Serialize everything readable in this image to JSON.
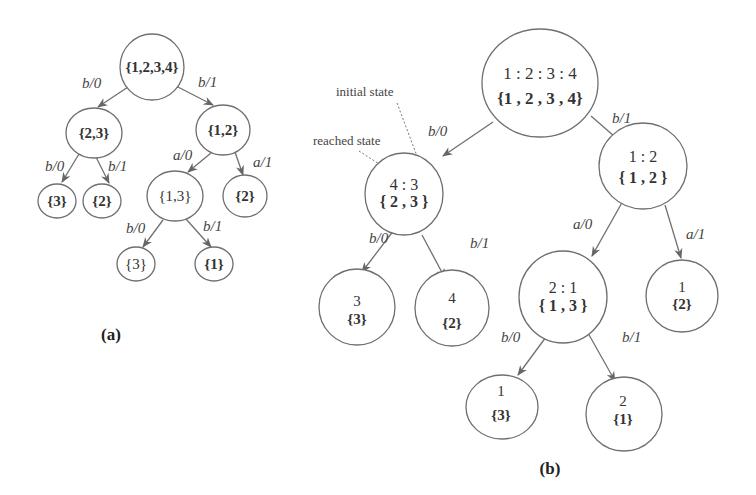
{
  "panel_a": {
    "caption": "(a)",
    "nodes": [
      {
        "id": "a_root",
        "set": "{1,2,3,4}",
        "bold": true
      },
      {
        "id": "a_23",
        "set": "{2,3}",
        "bold": true
      },
      {
        "id": "a_12",
        "set": "{1,2}",
        "bold": true
      },
      {
        "id": "a_3l",
        "set": "{3}",
        "bold": true
      },
      {
        "id": "a_2l",
        "set": "{2}",
        "bold": true
      },
      {
        "id": "a_13",
        "set": "{1,3}",
        "bold": false
      },
      {
        "id": "a_2r",
        "set": "{2}",
        "bold": true
      },
      {
        "id": "a_3b",
        "set": "{3}",
        "bold": false
      },
      {
        "id": "a_1b",
        "set": "{1}",
        "bold": true
      }
    ],
    "edges": [
      {
        "from": "a_root",
        "to": "a_23",
        "label": "b/0"
      },
      {
        "from": "a_root",
        "to": "a_12",
        "label": "b/1"
      },
      {
        "from": "a_23",
        "to": "a_3l",
        "label": "b/0"
      },
      {
        "from": "a_23",
        "to": "a_2l",
        "label": "b/1"
      },
      {
        "from": "a_12",
        "to": "a_13",
        "label": "a/0"
      },
      {
        "from": "a_12",
        "to": "a_2r",
        "label": "a/1"
      },
      {
        "from": "a_13",
        "to": "a_3b",
        "label": "b/0"
      },
      {
        "from": "a_13",
        "to": "a_1b",
        "label": "b/1"
      }
    ]
  },
  "panel_b": {
    "caption": "(b)",
    "annotations": {
      "initial_state": "initial state",
      "reached_state": "reached state"
    },
    "nodes": [
      {
        "id": "b_root",
        "state": "1 : 2 : 3 : 4",
        "set": "{1 , 2 , 3 , 4}"
      },
      {
        "id": "b_23",
        "state": "4 : 3",
        "set": "{ 2 , 3 }"
      },
      {
        "id": "b_12",
        "state": "1 : 2",
        "set": "{ 1 , 2 }"
      },
      {
        "id": "b_3",
        "state": "3",
        "set": "{3}"
      },
      {
        "id": "b_2a",
        "state": "4",
        "set": "{2}"
      },
      {
        "id": "b_13",
        "state": "2 : 1",
        "set": "{ 1 , 3 }"
      },
      {
        "id": "b_2b",
        "state": "1",
        "set": "{2}"
      },
      {
        "id": "b_3b",
        "state": "1",
        "set": "{3}"
      },
      {
        "id": "b_1",
        "state": "2",
        "set": "{1}"
      }
    ],
    "edges": [
      {
        "from": "b_root",
        "to": "b_23",
        "label": "b/0"
      },
      {
        "from": "b_root",
        "to": "b_12",
        "label": "b/1"
      },
      {
        "from": "b_23",
        "to": "b_3",
        "label": "b/0"
      },
      {
        "from": "b_23",
        "to": "b_2a",
        "label": "b/1"
      },
      {
        "from": "b_12",
        "to": "b_13",
        "label": "a/0"
      },
      {
        "from": "b_12",
        "to": "b_2b",
        "label": "a/1"
      },
      {
        "from": "b_13",
        "to": "b_3b",
        "label": "b/0"
      },
      {
        "from": "b_13",
        "to": "b_1",
        "label": "b/1"
      }
    ]
  }
}
